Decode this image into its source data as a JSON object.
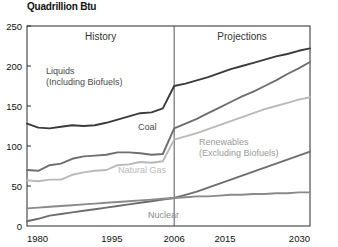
{
  "chart_data": {
    "type": "line",
    "title": "Quadrillion Btu",
    "xlabel": "",
    "ylabel": "Quadrillion Btu",
    "xlim": [
      1980,
      2030
    ],
    "ylim": [
      0,
      250
    ],
    "yticks": [
      0,
      50,
      100,
      150,
      200,
      250
    ],
    "xticks": [
      1980,
      1995,
      2006,
      2015,
      2030
    ],
    "grid": false,
    "legend": "inline-annotations",
    "divider_year": 2006,
    "annotations": [
      {
        "name": "history",
        "text": "History",
        "x": 1993,
        "y": 232
      },
      {
        "name": "projections",
        "text": "Projections",
        "x": 2018,
        "y": 232
      }
    ],
    "series": [
      {
        "name": "Liquids (Including Biofuels)",
        "label_lines": [
          "Liquids",
          "(Including Biofuels)"
        ],
        "color": "#3b3b3b",
        "x": [
          1980,
          1982,
          1984,
          1986,
          1988,
          1990,
          1992,
          1994,
          1996,
          1998,
          2000,
          2002,
          2004,
          2006,
          2008,
          2010,
          2012,
          2014,
          2016,
          2018,
          2020,
          2022,
          2024,
          2026,
          2028,
          2030
        ],
        "values": [
          128,
          123,
          122,
          124,
          126,
          125,
          126,
          129,
          133,
          137,
          141,
          142,
          147,
          175,
          178,
          182,
          186,
          191,
          196,
          200,
          204,
          208,
          212,
          215,
          219,
          222
        ]
      },
      {
        "name": "Coal",
        "label_lines": [
          "Coal"
        ],
        "color": "#6e6e6e",
        "x": [
          1980,
          1982,
          1984,
          1986,
          1988,
          1990,
          1992,
          1994,
          1996,
          1998,
          2000,
          2002,
          2004,
          2006,
          2008,
          2010,
          2012,
          2014,
          2016,
          2018,
          2020,
          2022,
          2024,
          2026,
          2028,
          2030
        ],
        "values": [
          70,
          69,
          76,
          78,
          84,
          87,
          88,
          89,
          92,
          92,
          91,
          89,
          90,
          122,
          128,
          134,
          141,
          148,
          155,
          162,
          168,
          175,
          182,
          190,
          197,
          205
        ]
      },
      {
        "name": "Natural Gas",
        "label_lines": [
          "Natural Gas"
        ],
        "color": "#b9b9b9",
        "x": [
          1980,
          1982,
          1984,
          1986,
          1988,
          1990,
          1992,
          1994,
          1996,
          1998,
          2000,
          2002,
          2004,
          2006,
          2008,
          2010,
          2012,
          2014,
          2016,
          2018,
          2020,
          2022,
          2024,
          2026,
          2028,
          2030
        ],
        "values": [
          57,
          56,
          58,
          58,
          64,
          67,
          69,
          70,
          76,
          77,
          80,
          79,
          81,
          108,
          112,
          116,
          121,
          126,
          131,
          136,
          141,
          146,
          150,
          154,
          158,
          161
        ]
      },
      {
        "name": "Renewables (Excluding Biofuels)",
        "label_lines": [
          "Renewables",
          "(Excluding Biofuels)"
        ],
        "color": "#6e6e6e",
        "x": [
          1980,
          1982,
          1984,
          1986,
          1988,
          1990,
          1992,
          1994,
          1996,
          1998,
          2000,
          2002,
          2004,
          2006,
          2008,
          2010,
          2012,
          2014,
          2016,
          2018,
          2020,
          2022,
          2024,
          2026,
          2028,
          2030
        ],
        "values": [
          6,
          9,
          13,
          15,
          17,
          19,
          21,
          23,
          25,
          27,
          29,
          31,
          33,
          35,
          39,
          43,
          48,
          53,
          58,
          63,
          68,
          73,
          78,
          83,
          88,
          93
        ]
      },
      {
        "name": "Nuclear",
        "label_lines": [
          "Nuclear"
        ],
        "color": "#8a8a8a",
        "x": [
          1980,
          1982,
          1984,
          1986,
          1988,
          1990,
          1992,
          1994,
          1996,
          1998,
          2000,
          2002,
          2004,
          2006,
          2008,
          2010,
          2012,
          2014,
          2016,
          2018,
          2020,
          2022,
          2024,
          2026,
          2028,
          2030
        ],
        "values": [
          22,
          23,
          24,
          25,
          26,
          27,
          28,
          29,
          30,
          31,
          32,
          33,
          34,
          35,
          36,
          37,
          37,
          38,
          39,
          39,
          40,
          40,
          41,
          41,
          42,
          42
        ]
      }
    ],
    "series_label_positions": [
      {
        "series": "Liquids (Including Biofuels)",
        "x": 46,
        "y": 74,
        "align": "start",
        "color": "#4a4a4a"
      },
      {
        "series": "Coal",
        "x": 138,
        "y": 130,
        "align": "start",
        "color": "#4a4a4a"
      },
      {
        "series": "Natural Gas",
        "x": 118,
        "y": 173,
        "align": "start",
        "color": "#b9b9b9"
      },
      {
        "series": "Renewables (Excluding Biofuels)",
        "x": 199,
        "y": 145,
        "align": "start",
        "color": "#9a9a9a"
      },
      {
        "series": "Nuclear",
        "x": 148,
        "y": 218,
        "align": "start",
        "color": "#8a8a8a"
      }
    ]
  }
}
